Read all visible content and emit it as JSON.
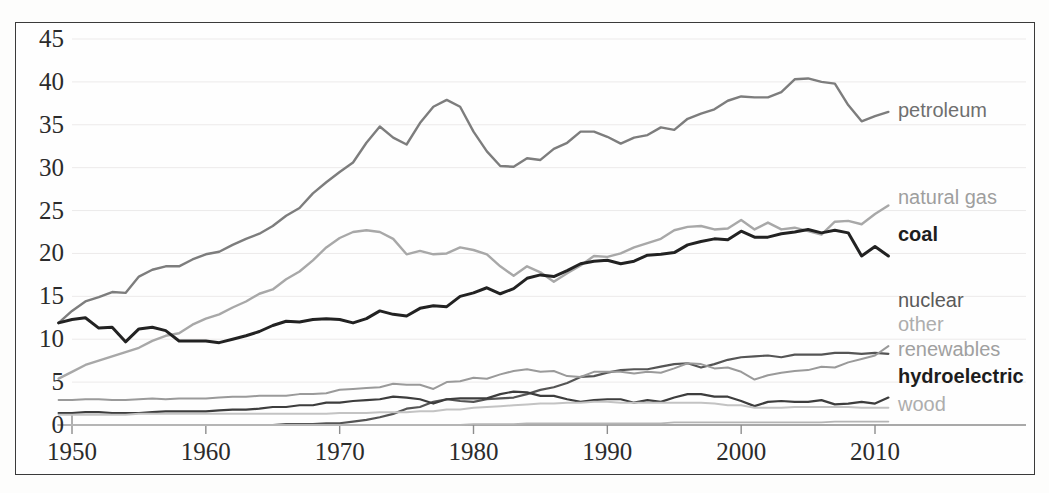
{
  "chart_data": {
    "type": "line",
    "title": "",
    "subtitle": "",
    "xlabel": "",
    "ylabel": "",
    "xlim": [
      1949,
      2011
    ],
    "ylim": [
      0,
      45
    ],
    "xticks": [
      1950,
      1960,
      1970,
      1980,
      1990,
      2000,
      2010
    ],
    "yticks": [
      0,
      5,
      10,
      15,
      20,
      25,
      30,
      35,
      40,
      45
    ],
    "grid": "faint-horizontal",
    "legend_position": "right-inline-labels",
    "x": [
      1949,
      1950,
      1951,
      1952,
      1953,
      1954,
      1955,
      1956,
      1957,
      1958,
      1959,
      1960,
      1961,
      1962,
      1963,
      1964,
      1965,
      1966,
      1967,
      1968,
      1969,
      1970,
      1971,
      1972,
      1973,
      1974,
      1975,
      1976,
      1977,
      1978,
      1979,
      1980,
      1981,
      1982,
      1983,
      1984,
      1985,
      1986,
      1987,
      1988,
      1989,
      1990,
      1991,
      1992,
      1993,
      1994,
      1995,
      1996,
      1997,
      1998,
      1999,
      2000,
      2001,
      2002,
      2003,
      2004,
      2005,
      2006,
      2007,
      2008,
      2009,
      2010,
      2011
    ],
    "series": [
      {
        "name": "petroleum",
        "color": "#7d7d7d",
        "width": 2.4,
        "label": "petroleum",
        "values": [
          11.9,
          13.3,
          14.4,
          14.9,
          15.5,
          15.4,
          17.3,
          18.1,
          18.5,
          18.5,
          19.3,
          19.9,
          20.2,
          21.0,
          21.7,
          22.3,
          23.2,
          24.4,
          25.3,
          27.0,
          28.3,
          29.5,
          30.6,
          32.9,
          34.8,
          33.5,
          32.7,
          35.2,
          37.1,
          37.9,
          37.1,
          34.2,
          31.9,
          30.2,
          30.1,
          31.1,
          30.9,
          32.2,
          32.9,
          34.2,
          34.2,
          33.6,
          32.8,
          33.5,
          33.8,
          34.7,
          34.4,
          35.7,
          36.3,
          36.8,
          37.8,
          38.3,
          38.2,
          38.2,
          38.8,
          40.3,
          40.4,
          40.0,
          39.8,
          37.3,
          35.4,
          36.0,
          36.5
        ]
      },
      {
        "name": "natural gas",
        "color": "#a8a8a8",
        "width": 2.4,
        "label": "natural gas",
        "values": [
          5.4,
          6.2,
          7.0,
          7.5,
          8.0,
          8.5,
          9.0,
          9.8,
          10.4,
          10.7,
          11.7,
          12.4,
          12.9,
          13.7,
          14.4,
          15.3,
          15.8,
          17.0,
          17.9,
          19.2,
          20.7,
          21.8,
          22.5,
          22.7,
          22.5,
          21.7,
          19.9,
          20.3,
          19.9,
          20.0,
          20.7,
          20.4,
          19.9,
          18.5,
          17.4,
          18.5,
          17.8,
          16.7,
          17.7,
          18.6,
          19.7,
          19.6,
          20.0,
          20.7,
          21.2,
          21.7,
          22.7,
          23.1,
          23.2,
          22.8,
          22.9,
          23.9,
          22.8,
          23.6,
          22.8,
          23.0,
          22.6,
          22.2,
          23.7,
          23.8,
          23.4,
          24.6,
          25.6
        ]
      },
      {
        "name": "coal",
        "color": "#222222",
        "width": 3.0,
        "label": "coal",
        "values": [
          11.9,
          12.3,
          12.5,
          11.3,
          11.4,
          9.7,
          11.2,
          11.4,
          11.0,
          9.8,
          9.8,
          9.8,
          9.6,
          10.0,
          10.4,
          10.9,
          11.6,
          12.1,
          12.0,
          12.3,
          12.4,
          12.3,
          11.9,
          12.4,
          13.3,
          12.9,
          12.7,
          13.6,
          13.9,
          13.8,
          15.0,
          15.4,
          16.0,
          15.3,
          15.9,
          17.1,
          17.5,
          17.3,
          18.0,
          18.8,
          19.1,
          19.2,
          18.8,
          19.1,
          19.8,
          19.9,
          20.1,
          21.0,
          21.4,
          21.7,
          21.6,
          22.6,
          21.9,
          21.9,
          22.3,
          22.5,
          22.8,
          22.4,
          22.7,
          22.4,
          19.7,
          20.8,
          19.7
        ]
      },
      {
        "name": "nuclear",
        "color": "#555555",
        "width": 2.2,
        "label": "nuclear",
        "values": [
          0.0,
          0.0,
          0.0,
          0.0,
          0.0,
          0.0,
          0.0,
          0.0,
          0.0,
          0.0,
          0.0,
          0.0,
          0.0,
          0.0,
          0.0,
          0.0,
          0.0,
          0.1,
          0.1,
          0.1,
          0.2,
          0.2,
          0.4,
          0.6,
          0.9,
          1.3,
          1.9,
          2.1,
          2.7,
          3.0,
          2.8,
          2.7,
          3.0,
          3.1,
          3.2,
          3.6,
          4.1,
          4.4,
          4.9,
          5.6,
          5.7,
          6.1,
          6.4,
          6.5,
          6.5,
          6.8,
          7.1,
          7.2,
          6.7,
          7.1,
          7.6,
          7.9,
          8.0,
          8.1,
          7.9,
          8.2,
          8.2,
          8.2,
          8.4,
          8.4,
          8.3,
          8.4,
          8.3
        ]
      },
      {
        "name": "other",
        "color": "#b5b5b5",
        "width": 1.8,
        "label": "other",
        "values": [
          0.0,
          0.0,
          0.0,
          0.0,
          0.0,
          0.0,
          0.0,
          0.0,
          0.0,
          0.0,
          0.0,
          0.0,
          0.0,
          0.0,
          0.0,
          0.0,
          0.0,
          0.0,
          0.0,
          0.0,
          0.0,
          0.0,
          0.0,
          0.0,
          0.0,
          0.0,
          0.0,
          0.0,
          0.0,
          0.0,
          0.0,
          0.1,
          0.1,
          0.1,
          0.1,
          0.2,
          0.2,
          0.2,
          0.2,
          0.2,
          0.2,
          0.2,
          0.2,
          0.2,
          0.2,
          0.2,
          0.3,
          0.3,
          0.3,
          0.3,
          0.3,
          0.3,
          0.3,
          0.3,
          0.3,
          0.3,
          0.3,
          0.3,
          0.4,
          0.4,
          0.4,
          0.4,
          0.4
        ]
      },
      {
        "name": "renewables",
        "color": "#9a9a9a",
        "width": 2.0,
        "label": "renewables",
        "values": [
          2.9,
          2.9,
          3.0,
          3.0,
          2.9,
          2.9,
          3.0,
          3.1,
          3.0,
          3.1,
          3.1,
          3.1,
          3.2,
          3.3,
          3.3,
          3.4,
          3.4,
          3.4,
          3.6,
          3.6,
          3.7,
          4.1,
          4.2,
          4.3,
          4.4,
          4.8,
          4.7,
          4.7,
          4.2,
          5.0,
          5.1,
          5.5,
          5.4,
          5.9,
          6.3,
          6.5,
          6.2,
          6.3,
          5.7,
          5.6,
          6.2,
          6.2,
          6.2,
          6.0,
          6.2,
          6.1,
          6.6,
          7.2,
          7.1,
          6.6,
          6.7,
          6.2,
          5.3,
          5.8,
          6.1,
          6.3,
          6.4,
          6.8,
          6.7,
          7.3,
          7.7,
          8.1,
          9.2
        ]
      },
      {
        "name": "hydroelectric",
        "color": "#3d3d3d",
        "width": 2.2,
        "label": "hydroelectric",
        "values": [
          1.4,
          1.4,
          1.5,
          1.5,
          1.4,
          1.4,
          1.4,
          1.5,
          1.6,
          1.6,
          1.6,
          1.6,
          1.7,
          1.8,
          1.8,
          1.9,
          2.1,
          2.1,
          2.3,
          2.3,
          2.6,
          2.6,
          2.8,
          2.9,
          3.0,
          3.3,
          3.2,
          3.0,
          2.5,
          3.0,
          3.1,
          3.1,
          3.1,
          3.6,
          3.9,
          3.8,
          3.4,
          3.4,
          3.0,
          2.7,
          2.9,
          3.0,
          3.0,
          2.6,
          2.9,
          2.7,
          3.2,
          3.6,
          3.6,
          3.3,
          3.3,
          2.8,
          2.2,
          2.7,
          2.8,
          2.7,
          2.7,
          2.9,
          2.4,
          2.5,
          2.7,
          2.5,
          3.2
        ]
      },
      {
        "name": "wood",
        "color": "#c3c3c3",
        "width": 2.0,
        "label": "wood",
        "values": [
          1.2,
          1.2,
          1.2,
          1.2,
          1.2,
          1.2,
          1.3,
          1.3,
          1.3,
          1.3,
          1.3,
          1.3,
          1.3,
          1.3,
          1.3,
          1.3,
          1.3,
          1.3,
          1.3,
          1.3,
          1.3,
          1.4,
          1.4,
          1.4,
          1.5,
          1.5,
          1.5,
          1.6,
          1.6,
          1.8,
          1.8,
          2.0,
          2.1,
          2.2,
          2.3,
          2.4,
          2.5,
          2.5,
          2.6,
          2.6,
          2.7,
          2.7,
          2.6,
          2.6,
          2.6,
          2.6,
          2.6,
          2.6,
          2.6,
          2.5,
          2.3,
          2.3,
          2.0,
          2.0,
          2.0,
          2.1,
          2.1,
          2.1,
          2.1,
          2.1,
          2.0,
          2.0,
          2.0
        ]
      }
    ],
    "series_labels": [
      {
        "name": "petroleum",
        "text": "petroleum",
        "color": "#6f6f6f",
        "weight": "400",
        "x": 898,
        "y": 110
      },
      {
        "name": "natural-gas",
        "text": "natural gas",
        "color": "#9e9e9e",
        "weight": "400",
        "x": 898,
        "y": 197
      },
      {
        "name": "coal",
        "text": "coal",
        "color": "#1d1d1d",
        "weight": "700",
        "x": 898,
        "y": 234
      },
      {
        "name": "nuclear",
        "text": "nuclear",
        "color": "#5a5a5a",
        "weight": "400",
        "x": 898,
        "y": 300
      },
      {
        "name": "other",
        "text": "other",
        "color": "#adadad",
        "weight": "400",
        "x": 898,
        "y": 324
      },
      {
        "name": "renewables",
        "text": "renewables",
        "color": "#a0a0a0",
        "weight": "400",
        "x": 898,
        "y": 349
      },
      {
        "name": "hydroelectric",
        "text": "hydroelectric",
        "color": "#1d1d1d",
        "weight": "700",
        "x": 898,
        "y": 376
      },
      {
        "name": "wood",
        "text": "wood",
        "color": "#adadad",
        "weight": "400",
        "x": 898,
        "y": 404
      }
    ]
  }
}
